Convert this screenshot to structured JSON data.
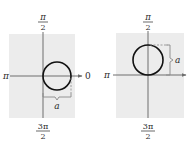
{
  "figures": [
    {
      "id": "left",
      "description": "Polar graph: circle tangent to vertical axis at pole, centered on polar axis (r = a cos θ)",
      "labels": {
        "top_num": "π",
        "top_den": "2",
        "bottom_num": "3π",
        "bottom_den": "2",
        "left": "π",
        "right": "0",
        "param": "a"
      }
    },
    {
      "id": "right",
      "description": "Polar graph: circle tangent to horizontal axis at pole, centered on π/2 line (r = a sin θ)",
      "labels": {
        "top_num": "π",
        "top_den": "2",
        "bottom_num": "3π",
        "bottom_den": "2",
        "left": "π",
        "param": "a"
      }
    }
  ],
  "colors": {
    "panel": "#ececec",
    "axis": "#6e6e6e",
    "circle": "#111111",
    "brace": "#8a8a8a"
  }
}
